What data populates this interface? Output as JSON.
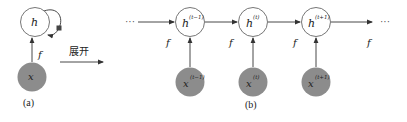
{
  "diagram": {
    "colors": {
      "hidden_fill": "#ffffff",
      "hidden_stroke": "#666666",
      "input_fill": "#8c8c8c",
      "edge": "#333333",
      "loop_square": "#444444"
    },
    "panel_a": {
      "caption": "(a)",
      "hidden_node": {
        "label": "h"
      },
      "input_node": {
        "label": "x"
      },
      "edge_label": "f",
      "self_loop": true
    },
    "unfold_arrow": {
      "label": "展开"
    },
    "panel_b": {
      "caption": "(b)",
      "leading_ellipsis": "···",
      "trailing_ellipsis": "···",
      "steps": [
        {
          "hidden_label": "h",
          "hidden_sup": "(t−1)",
          "input_label": "x",
          "input_sup": "(t−1)"
        },
        {
          "hidden_label": "h",
          "hidden_sup": "(t)",
          "input_label": "x",
          "input_sup": "(t)"
        },
        {
          "hidden_label": "h",
          "hidden_sup": "(t+1)",
          "input_label": "x",
          "input_sup": "(t+1)"
        }
      ],
      "edge_labels": [
        "f",
        "f",
        "f",
        "f"
      ]
    }
  }
}
